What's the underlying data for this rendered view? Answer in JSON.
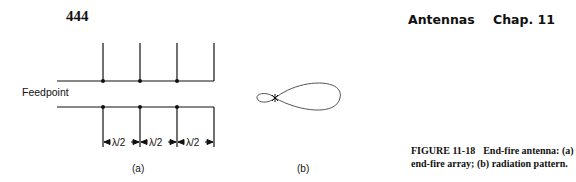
{
  "page": {
    "number": "444",
    "running_title": "Antennas",
    "chapter": "Chap. 11"
  },
  "figure": {
    "label": "FIGURE 11-18",
    "caption_line1": "End-fire antenna: (a)",
    "caption_line2": "end-fire array; (b) radiation pattern.",
    "feedpoint_label": "Feedpoint",
    "spacing_labels": [
      "λ/2",
      "λ/2",
      "λ/2"
    ],
    "subfigure_a": "(a)",
    "subfigure_b": "(b)"
  }
}
